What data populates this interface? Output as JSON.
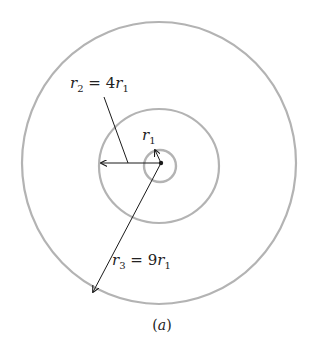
{
  "diagram": {
    "type": "concentric-circles",
    "labels": {
      "r1": {
        "var": "r",
        "sub": "1"
      },
      "r2": {
        "var": "r",
        "sub": "2",
        "eq": " = 4",
        "var2": "r",
        "sub2": "1"
      },
      "r3": {
        "var": "r",
        "sub": "3",
        "eq": " = 9",
        "var2": "r",
        "sub2": "1"
      }
    },
    "caption": {
      "open": "(",
      "letter": "a",
      "close": ")"
    },
    "colors": {
      "circle": "#b3b3b3",
      "arrow": "#1a1a1a",
      "text": "#222222"
    },
    "circles": [
      {
        "name": "inner",
        "radius_label": "r1"
      },
      {
        "name": "middle",
        "radius_label": "r2 = 4r1"
      },
      {
        "name": "outer",
        "radius_label": "r3 = 9r1"
      }
    ]
  }
}
